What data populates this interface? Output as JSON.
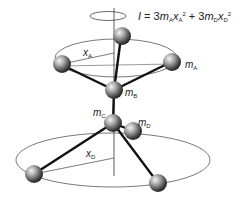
{
  "formula": {
    "I": "I",
    "eq": " = 3",
    "mA": "m",
    "mA_sub": "A",
    "xA": "x",
    "xA_sub": "A",
    "xA_sup": "2",
    "plus": " + 3",
    "mD": "m",
    "mD_sub": "D",
    "xD": "x",
    "xD_sub": "D",
    "xD_sup": "2"
  },
  "labels": {
    "xA": {
      "main": "x",
      "sub": "A"
    },
    "mA": {
      "main": "m",
      "sub": "A"
    },
    "mB": {
      "main": "m",
      "sub": "B"
    },
    "mC": {
      "main": "m",
      "sub": "C"
    },
    "mD": {
      "main": "m",
      "sub": "D"
    },
    "xD": {
      "main": "x",
      "sub": "D"
    }
  },
  "colors": {
    "line": "#111111",
    "ring": "#555555",
    "sphere_light": "#e8e8e8",
    "sphere_dark": "#2a2a2a"
  }
}
